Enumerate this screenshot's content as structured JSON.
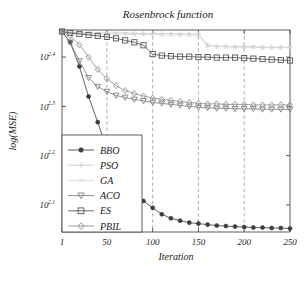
{
  "chart_data": {
    "type": "line",
    "title": "Rosenbrock function",
    "xlabel": "Iteration",
    "ylabel": "log(MSE)",
    "xlim": [
      1,
      250
    ],
    "ylim_log10": [
      2.045,
      2.455
    ],
    "yscale": "log",
    "grid": "vertical-dashed",
    "legend_position": "lower-left-inside",
    "xticks": [
      1,
      50,
      100,
      150,
      200,
      250
    ],
    "xtick_labels": [
      "1",
      "50",
      "100",
      "150",
      "200",
      "250"
    ],
    "yticks_log10": [
      2.4,
      2.3,
      2.2,
      2.1
    ],
    "ytick_labels": [
      "10",
      "10",
      "10",
      "10"
    ],
    "ytick_exponents": [
      "2.4",
      "2.3",
      "2.2",
      "2.1"
    ],
    "gridlines_x": [
      50,
      100,
      150,
      200
    ],
    "x": [
      1,
      10,
      20,
      30,
      40,
      50,
      60,
      70,
      80,
      90,
      100,
      110,
      120,
      130,
      140,
      150,
      160,
      170,
      180,
      190,
      200,
      210,
      220,
      230,
      240,
      250
    ],
    "series": [
      {
        "name": "BBO",
        "marker": "filled-circle",
        "color": "#3c3c3c",
        "values_log10": [
          2.452,
          2.43,
          2.381,
          2.32,
          2.268,
          2.213,
          2.175,
          2.148,
          2.125,
          2.108,
          2.094,
          2.081,
          2.073,
          2.068,
          2.064,
          2.062,
          2.06,
          2.058,
          2.057,
          2.056,
          2.055,
          2.054,
          2.054,
          2.053,
          2.053,
          2.052
        ]
      },
      {
        "name": "PSO",
        "marker": "plus",
        "color": "#c9c9c9",
        "values_log10": [
          2.451,
          2.45,
          2.45,
          2.449,
          2.449,
          2.449,
          2.449,
          2.449,
          2.448,
          2.448,
          2.448,
          2.448,
          2.448,
          2.447,
          2.447,
          2.447,
          2.424,
          2.422,
          2.422,
          2.421,
          2.421,
          2.421,
          2.42,
          2.42,
          2.42,
          2.42
        ]
      },
      {
        "name": "GA",
        "marker": "x",
        "color": "#d6d6d6",
        "values_log10": [
          2.45,
          2.449,
          2.448,
          2.448,
          2.447,
          2.447,
          2.447,
          2.446,
          2.446,
          2.446,
          2.446,
          2.445,
          2.445,
          2.445,
          2.445,
          2.444,
          2.423,
          2.421,
          2.421,
          2.42,
          2.42,
          2.42,
          2.419,
          2.419,
          2.419,
          2.419
        ]
      },
      {
        "name": "ACO",
        "marker": "triangle-down",
        "color": "#7a7a7a",
        "values_log10": [
          2.451,
          2.43,
          2.392,
          2.358,
          2.34,
          2.33,
          2.322,
          2.318,
          2.314,
          2.311,
          2.308,
          2.306,
          2.304,
          2.302,
          2.3,
          2.298,
          2.297,
          2.296,
          2.296,
          2.295,
          2.295,
          2.295,
          2.294,
          2.294,
          2.294,
          2.294
        ]
      },
      {
        "name": "ES",
        "marker": "square",
        "color": "#4d4d4d",
        "values_log10": [
          2.452,
          2.449,
          2.447,
          2.445,
          2.443,
          2.441,
          2.438,
          2.434,
          2.43,
          2.424,
          2.406,
          2.403,
          2.402,
          2.401,
          2.401,
          2.4,
          2.4,
          2.399,
          2.399,
          2.399,
          2.398,
          2.397,
          2.396,
          2.395,
          2.394,
          2.393
        ]
      },
      {
        "name": "PBIL",
        "marker": "diamond",
        "color": "#8a8a8a",
        "values_log10": [
          2.452,
          2.443,
          2.425,
          2.4,
          2.375,
          2.356,
          2.342,
          2.332,
          2.326,
          2.321,
          2.317,
          2.314,
          2.312,
          2.31,
          2.308,
          2.306,
          2.305,
          2.305,
          2.304,
          2.304,
          2.304,
          2.303,
          2.303,
          2.303,
          2.303,
          2.303
        ]
      }
    ],
    "legend_entries": [
      {
        "label": "BBO",
        "marker": "filled-circle",
        "color": "#3c3c3c"
      },
      {
        "label": "PSO",
        "marker": "plus",
        "color": "#c9c9c9"
      },
      {
        "label": "GA",
        "marker": "x",
        "color": "#d6d6d6"
      },
      {
        "label": "ACO",
        "marker": "triangle-down",
        "color": "#7a7a7a"
      },
      {
        "label": "ES",
        "marker": "square",
        "color": "#4d4d4d"
      },
      {
        "label": "PBIL",
        "marker": "diamond",
        "color": "#8a8a8a"
      }
    ]
  },
  "colors": {
    "axis": "#4a4a4a",
    "grid": "#9a9a9a",
    "text": "#1a1a1a",
    "background": "#ffffff"
  }
}
